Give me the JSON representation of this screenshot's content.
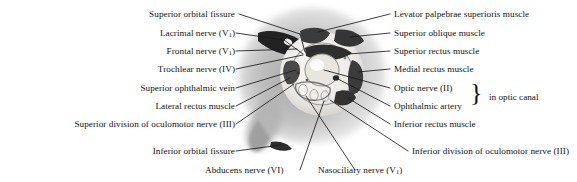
{
  "figure": {
    "kind": "anatomical-photograph",
    "background_color": "#ffffff",
    "leader_line_color": "#1a1a1a",
    "specimen": {
      "halo_color": "#cfcfcf",
      "tissue_color": "#9a9a9a",
      "dark_structure_color": "#2a2a2a",
      "bone_color": "#f2f0ec"
    }
  },
  "labels_left": [
    {
      "id": "superior-orbital-fissure",
      "text": "Superior orbital fissure",
      "suffix": ""
    },
    {
      "id": "lacrimal-nerve",
      "text": "Lacrimal nerve (V",
      "sub": "1",
      "suffix": ")"
    },
    {
      "id": "frontal-nerve",
      "text": "Frontal nerve (V",
      "sub": "1",
      "suffix": ")"
    },
    {
      "id": "trochlear-nerve",
      "text": "Trochlear nerve (IV)",
      "suffix": ""
    },
    {
      "id": "superior-ophthalmic-vein",
      "text": "Superior ophthalmic vein",
      "suffix": ""
    },
    {
      "id": "lateral-rectus-muscle",
      "text": "Lateral rectus muscle",
      "suffix": ""
    },
    {
      "id": "superior-division-oculomotor",
      "text": "Superior division of oculomotor nerve (III)",
      "suffix": ""
    },
    {
      "id": "inferior-orbital-fissure",
      "text": "Inferior orbital fissure",
      "suffix": ""
    }
  ],
  "labels_right": [
    {
      "id": "levator-palpebrae-superioris-muscle",
      "text": "Levator palpebrae superioris muscle",
      "suffix": ""
    },
    {
      "id": "superior-oblique-muscle",
      "text": "Superior oblique muscle",
      "suffix": ""
    },
    {
      "id": "superior-rectus-muscle",
      "text": "Superior rectus muscle",
      "suffix": ""
    },
    {
      "id": "medial-rectus-muscle",
      "text": "Medial rectus muscle",
      "suffix": ""
    },
    {
      "id": "optic-nerve",
      "text": "Optic nerve (II)",
      "suffix": ""
    },
    {
      "id": "ophthalmic-artery",
      "text": "Ophthalmic artery",
      "suffix": ""
    },
    {
      "id": "inferior-rectus-muscle",
      "text": "Inferior rectus muscle",
      "suffix": ""
    },
    {
      "id": "inferior-division-oculomotor",
      "text": "Inferior division of oculomotor nerve (III)",
      "suffix": ""
    }
  ],
  "labels_bottom": [
    {
      "id": "abducens-nerve",
      "text": "Abducens nerve (VI)",
      "suffix": ""
    },
    {
      "id": "nasociliary-nerve",
      "text": "Nasociliary nerve (V",
      "sub": "1",
      "suffix": ")"
    }
  ],
  "bracket": {
    "id": "in-optic-canal",
    "glyph": "}",
    "text": "in optic canal",
    "groups": [
      "optic-nerve",
      "ophthalmic-artery"
    ]
  }
}
